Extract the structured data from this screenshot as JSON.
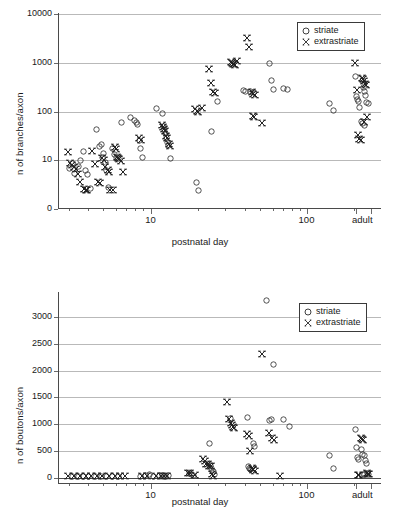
{
  "figure": {
    "panels": [
      "branches-panel",
      "boutons-panel"
    ]
  },
  "legend": {
    "striate_label": "striate",
    "extrastriate_label": "extrastriate",
    "striate_marker": "circle-marker-icon",
    "extrastriate_marker": "bowtie-marker-icon"
  },
  "chart_data": [
    {
      "id": "branches",
      "type": "scatter",
      "title": "",
      "xlabel": "postnatal day",
      "ylabel": "n of branches/axon",
      "xscale": "log",
      "yscale": "log",
      "xlim": [
        2.6,
        300
      ],
      "ylim": [
        1,
        10000
      ],
      "xticks": [
        10,
        100
      ],
      "xticklabels": [
        "10",
        "100"
      ],
      "x_extra_tick_label": "adult",
      "yticks": [
        1,
        10,
        100,
        1000,
        10000
      ],
      "yticklabels": [
        "0",
        "10",
        "100",
        "1000",
        "10000"
      ],
      "grid": "horizontal",
      "legend_position": "top-right",
      "series": [
        {
          "name": "striate",
          "marker": "circle",
          "points": [
            [
              3.1,
              6.5
            ],
            [
              3.2,
              8.0
            ],
            [
              3.3,
              5.2
            ],
            [
              3.5,
              7.0
            ],
            [
              3.6,
              9.5
            ],
            [
              3.8,
              14.5
            ],
            [
              3.9,
              6.0
            ],
            [
              4.0,
              4.8
            ],
            [
              4.2,
              2.5
            ],
            [
              4.6,
              40.0
            ],
            [
              4.8,
              18.0
            ],
            [
              4.9,
              20.0
            ],
            [
              5.0,
              11.0
            ],
            [
              5.1,
              13.0
            ],
            [
              5.2,
              8.5
            ],
            [
              5.3,
              6.0
            ],
            [
              5.5,
              2.6
            ],
            [
              5.8,
              17.0
            ],
            [
              6.0,
              12.5
            ],
            [
              6.1,
              11.0
            ],
            [
              6.3,
              10.5
            ],
            [
              6.6,
              56.0
            ],
            [
              7.6,
              71.0
            ],
            [
              8.0,
              62.0
            ],
            [
              8.2,
              56.0
            ],
            [
              8.4,
              52.0
            ],
            [
              8.6,
              24.0
            ],
            [
              8.8,
              17.0
            ],
            [
              9.0,
              11.0
            ],
            [
              11.0,
              110.0
            ],
            [
              12.0,
              88.0
            ],
            [
              12.2,
              48.0
            ],
            [
              12.4,
              40.0
            ],
            [
              12.6,
              33.0
            ],
            [
              12.8,
              28.0
            ],
            [
              13.0,
              22.0
            ],
            [
              13.2,
              19.0
            ],
            [
              13.5,
              10.5
            ],
            [
              20.0,
              3.4
            ],
            [
              20.5,
              2.3
            ],
            [
              25.0,
              37.0
            ],
            [
              27.0,
              155.0
            ],
            [
              40.0,
              260.0
            ],
            [
              41.0,
              240.0
            ],
            [
              44.0,
              250.0
            ],
            [
              46.0,
              230.0
            ],
            [
              58.0,
              930.0
            ],
            [
              60.0,
              410.0
            ],
            [
              62.0,
              270.0
            ],
            [
              72.0,
              280.0
            ],
            [
              76.0,
              275.0
            ],
            [
              140.0,
              140.0
            ],
            [
              150.0,
              100.0
            ],
            [
              205.0,
              500.0
            ],
            [
              208.0,
              190.0
            ],
            [
              212.0,
              170.0
            ],
            [
              215.0,
              150.0
            ],
            [
              218.0,
              115.0
            ],
            [
              228.0,
              420.0
            ],
            [
              232.0,
              300.0
            ],
            [
              236.0,
              250.0
            ],
            [
              240.0,
              200.0
            ],
            [
              244.0,
              145.0
            ],
            [
              248.0,
              140.0
            ],
            [
              226.0,
              60.0
            ],
            [
              230.0,
              55.0
            ],
            [
              234.0,
              50.0
            ]
          ]
        },
        {
          "name": "extrastriate",
          "marker": "bowtie",
          "points": [
            [
              3.0,
              14.0
            ],
            [
              3.1,
              8.2
            ],
            [
              3.2,
              7.5
            ],
            [
              3.3,
              6.8
            ],
            [
              3.4,
              6.2
            ],
            [
              3.5,
              5.0
            ],
            [
              3.6,
              3.4
            ],
            [
              3.8,
              2.4
            ],
            [
              3.9,
              2.3
            ],
            [
              4.0,
              2.3
            ],
            [
              4.3,
              15.0
            ],
            [
              4.5,
              8.0
            ],
            [
              4.7,
              3.4
            ],
            [
              4.8,
              3.3
            ],
            [
              5.0,
              10.5
            ],
            [
              5.1,
              9.5
            ],
            [
              5.2,
              7.0
            ],
            [
              5.4,
              6.0
            ],
            [
              5.5,
              5.5
            ],
            [
              5.6,
              2.3
            ],
            [
              5.8,
              2.3
            ],
            [
              6.0,
              18.0
            ],
            [
              6.1,
              16.0
            ],
            [
              6.2,
              11.0
            ],
            [
              6.3,
              10.5
            ],
            [
              6.4,
              10.0
            ],
            [
              6.6,
              9.0
            ],
            [
              6.8,
              5.6
            ],
            [
              8.5,
              27.0
            ],
            [
              8.8,
              25.0
            ],
            [
              12.0,
              50.0
            ],
            [
              12.2,
              45.0
            ],
            [
              12.4,
              42.0
            ],
            [
              12.6,
              38.0
            ],
            [
              12.8,
              30.0
            ],
            [
              13.0,
              27.0
            ],
            [
              13.2,
              21.0
            ],
            [
              13.4,
              19.0
            ],
            [
              19.5,
              105.0
            ],
            [
              20.0,
              98.0
            ],
            [
              20.5,
              95.0
            ],
            [
              21.5,
              115.0
            ],
            [
              24.0,
              720.0
            ],
            [
              24.5,
              370.0
            ],
            [
              25.5,
              240.0
            ],
            [
              26.0,
              230.0
            ],
            [
              33.0,
              1000.0
            ],
            [
              33.5,
              950.0
            ],
            [
              34.0,
              900.0
            ],
            [
              34.5,
              880.0
            ],
            [
              35.0,
              860.0
            ],
            [
              36.0,
              1050.0
            ],
            [
              42.0,
              3000.0
            ],
            [
              43.0,
              2000.0
            ],
            [
              45.0,
              240.0
            ],
            [
              46.0,
              220.0
            ],
            [
              47.0,
              205.0
            ],
            [
              45.5,
              78.0
            ],
            [
              46.5,
              74.0
            ],
            [
              52.0,
              56.0
            ],
            [
              205.0,
              960.0
            ],
            [
              210.0,
              260.0
            ],
            [
              228.0,
              470.0
            ],
            [
              231.0,
              440.0
            ],
            [
              234.0,
              400.0
            ],
            [
              237.0,
              350.0
            ],
            [
              240.0,
              330.0
            ],
            [
              214.0,
              32.0
            ],
            [
              218.0,
              26.0
            ],
            [
              222.0,
              25.0
            ],
            [
              232.0,
              58.0
            ],
            [
              244.0,
              72.0
            ]
          ]
        }
      ]
    },
    {
      "id": "boutons",
      "type": "scatter",
      "title": "",
      "xlabel": "postnatal day",
      "ylabel": "n of boutons/axon",
      "xscale": "log",
      "yscale": "linear",
      "xlim": [
        2.6,
        300
      ],
      "ylim": [
        -120,
        3450
      ],
      "xticks": [
        10,
        100
      ],
      "xticklabels": [
        "10",
        "100"
      ],
      "x_extra_tick_label": "adult",
      "yticks": [
        0,
        500,
        1000,
        1500,
        2000,
        2500,
        3000
      ],
      "yticklabels": [
        "0",
        "500",
        "1000",
        "1500",
        "2000",
        "2500",
        "3000"
      ],
      "grid": "horizontal",
      "legend_position": "top-right",
      "series": [
        {
          "name": "striate",
          "marker": "circle",
          "points": [
            [
              3.2,
              5
            ],
            [
              3.5,
              5
            ],
            [
              3.8,
              5
            ],
            [
              4.1,
              5
            ],
            [
              4.5,
              5
            ],
            [
              4.9,
              5
            ],
            [
              5.3,
              5
            ],
            [
              5.8,
              5
            ],
            [
              6.3,
              5
            ],
            [
              8.8,
              10
            ],
            [
              9.4,
              12
            ],
            [
              10.0,
              30
            ],
            [
              10.6,
              10
            ],
            [
              11.5,
              12
            ],
            [
              12.0,
              14
            ],
            [
              12.6,
              10
            ],
            [
              13.2,
              12
            ],
            [
              18.0,
              60
            ],
            [
              18.5,
              30
            ],
            [
              19.0,
              20
            ],
            [
              24.0,
              620
            ],
            [
              24.5,
              210
            ],
            [
              25.0,
              150
            ],
            [
              25.5,
              90
            ],
            [
              26.0,
              30
            ],
            [
              33.0,
              1090
            ],
            [
              42.0,
              1110
            ],
            [
              43.0,
              185
            ],
            [
              43.5,
              150
            ],
            [
              44.0,
              140
            ],
            [
              46.0,
              620
            ],
            [
              47.0,
              570
            ],
            [
              56.0,
              3300
            ],
            [
              58.0,
              1040
            ],
            [
              60.0,
              1060
            ],
            [
              62.0,
              2100
            ],
            [
              72.0,
              1060
            ],
            [
              78.0,
              930
            ],
            [
              140.0,
              385
            ],
            [
              150.0,
              155
            ],
            [
              205.0,
              880
            ],
            [
              208.0,
              540
            ],
            [
              212.0,
              350
            ],
            [
              214.0,
              320
            ],
            [
              226.0,
              500
            ],
            [
              230.0,
              420
            ],
            [
              234.0,
              400
            ],
            [
              238.0,
              300
            ],
            [
              242.0,
              250
            ],
            [
              246.0,
              60
            ],
            [
              250.0,
              40
            ],
            [
              232.0,
              40
            ],
            [
              236.0,
              35
            ]
          ]
        },
        {
          "name": "extrastriate",
          "marker": "bowtie",
          "points": [
            [
              3.0,
              5
            ],
            [
              3.3,
              5
            ],
            [
              3.6,
              5
            ],
            [
              3.9,
              5
            ],
            [
              4.2,
              5
            ],
            [
              4.6,
              5
            ],
            [
              5.0,
              5
            ],
            [
              5.5,
              5
            ],
            [
              6.0,
              5
            ],
            [
              6.5,
              5
            ],
            [
              7.0,
              5
            ],
            [
              9.0,
              8
            ],
            [
              9.6,
              8
            ],
            [
              11.0,
              10
            ],
            [
              11.8,
              10
            ],
            [
              12.4,
              10
            ],
            [
              13.0,
              10
            ],
            [
              17.5,
              70
            ],
            [
              18.2,
              60
            ],
            [
              19.5,
              25
            ],
            [
              22.0,
              330
            ],
            [
              22.5,
              300
            ],
            [
              23.0,
              240
            ],
            [
              23.5,
              230
            ],
            [
              24.0,
              200
            ],
            [
              24.5,
              190
            ],
            [
              25.0,
              40
            ],
            [
              25.5,
              20
            ],
            [
              31.0,
              1390
            ],
            [
              32.0,
              1080
            ],
            [
              33.0,
              1010
            ],
            [
              33.5,
              960
            ],
            [
              34.0,
              920
            ],
            [
              34.5,
              905
            ],
            [
              42.0,
              800
            ],
            [
              43.0,
              760
            ],
            [
              44.0,
              480
            ],
            [
              45.0,
              160
            ],
            [
              45.5,
              140
            ],
            [
              46.0,
              120
            ],
            [
              47.0,
              100
            ],
            [
              52.0,
              2300
            ],
            [
              58.0,
              810
            ],
            [
              60.0,
              730
            ],
            [
              62.0,
              680
            ],
            [
              68.0,
              20
            ],
            [
              222.0,
              730
            ],
            [
              226.0,
              700
            ],
            [
              230.0,
              680
            ],
            [
              214.0,
              35
            ],
            [
              218.0,
              30
            ],
            [
              244.0,
              60
            ],
            [
              248.0,
              50
            ],
            [
              252.0,
              45
            ]
          ]
        }
      ]
    }
  ]
}
